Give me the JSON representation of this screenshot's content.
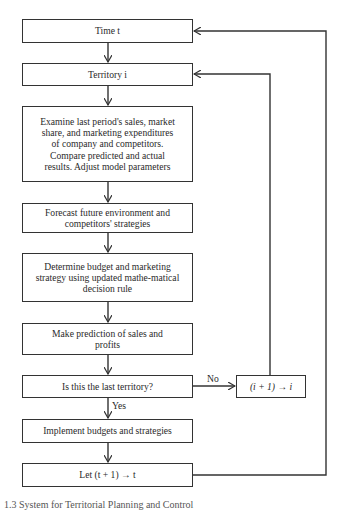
{
  "diagram": {
    "type": "flowchart",
    "nodes": {
      "time": {
        "label": "Time t"
      },
      "territory": {
        "label": "Territory i"
      },
      "examine": {
        "label": "Examine last period's sales, market share, and marketing expenditures of company and competitors. Compare predicted and actual results. Adjust model parameters"
      },
      "forecast": {
        "label": "Forecast future environment and competitors' strategies"
      },
      "determine": {
        "label": "Determine budget and marketing strategy using updated mathe-matical decision rule"
      },
      "predict": {
        "label": "Make prediction of sales and profits"
      },
      "decision": {
        "label": "Is this the last territory?"
      },
      "implement": {
        "label": "Implement budgets and strategies"
      },
      "increment_t": {
        "label": "Let (t + 1) → t"
      },
      "increment_i": {
        "label": "(i + 1) → i"
      }
    },
    "edge_labels": {
      "no": "No",
      "yes": "Yes"
    },
    "edges": [
      [
        "time",
        "territory"
      ],
      [
        "territory",
        "examine"
      ],
      [
        "examine",
        "forecast"
      ],
      [
        "forecast",
        "determine"
      ],
      [
        "determine",
        "predict"
      ],
      [
        "predict",
        "decision"
      ],
      [
        "decision",
        "increment_i",
        "No"
      ],
      [
        "increment_i",
        "territory"
      ],
      [
        "decision",
        "implement",
        "Yes"
      ],
      [
        "implement",
        "increment_t"
      ],
      [
        "increment_t",
        "time"
      ]
    ],
    "caption": "1.3  System for Territorial Planning and Control"
  }
}
